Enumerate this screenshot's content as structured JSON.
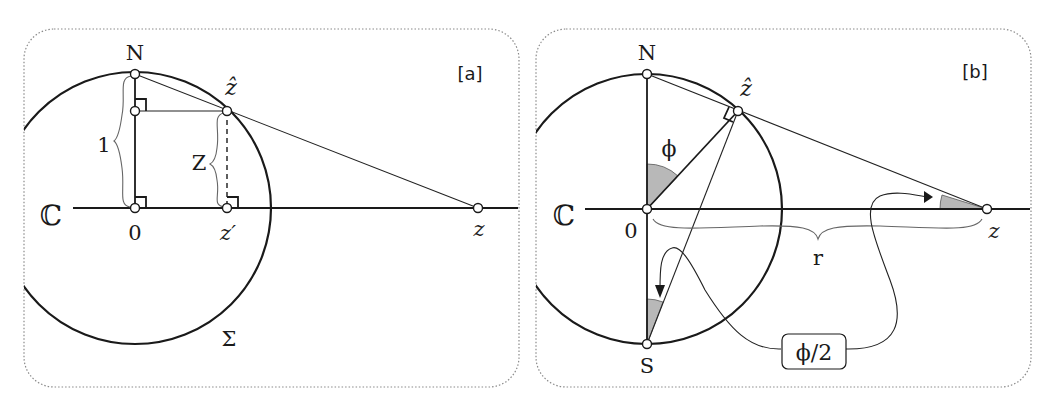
{
  "panels": [
    {
      "id": "a",
      "tag": "[a]",
      "labels": {
        "north": "N",
        "z_hat": "ẑ",
        "complex_plane": "ℂ",
        "origin": "0",
        "z_prime": "z′",
        "z": "z",
        "sphere": "Σ",
        "unit_height": "1",
        "height_Z": "Z"
      }
    },
    {
      "id": "b",
      "tag": "[b]",
      "labels": {
        "north": "N",
        "south": "S",
        "z_hat": "ẑ",
        "complex_plane": "ℂ",
        "origin": "0",
        "z": "z",
        "radius": "r",
        "angle_phi": "ϕ",
        "half_angle": "ϕ/2"
      }
    }
  ]
}
